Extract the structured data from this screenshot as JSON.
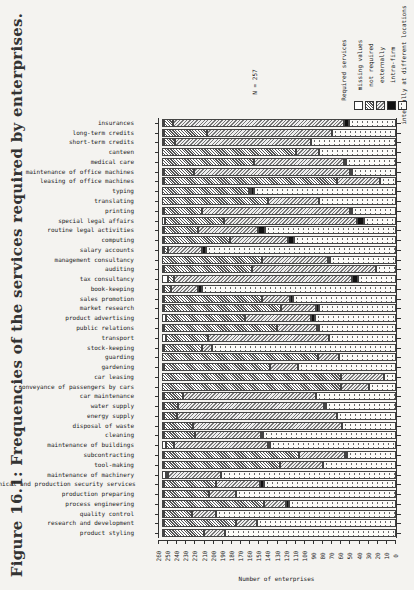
{
  "figure": {
    "title": "Figure 16.1: Frequencies of the services required by enterprises.",
    "n_label": "N = 257"
  },
  "legend": {
    "title": "Required services",
    "items": [
      {
        "key": "missing",
        "label": "missing values",
        "pattern": "p-missing"
      },
      {
        "key": "notreq",
        "label": "not required",
        "pattern": "p-notreq"
      },
      {
        "key": "ext",
        "label": "externally",
        "pattern": "p-ext"
      },
      {
        "key": "intra",
        "label": "intra-firm",
        "pattern": "p-intra"
      },
      {
        "key": "int",
        "label": "internally at different locations",
        "pattern": "p-int"
      }
    ]
  },
  "axis": {
    "xlabel": "Number of enterprises",
    "ticks": [
      260,
      250,
      240,
      230,
      220,
      210,
      200,
      190,
      180,
      170,
      160,
      150,
      140,
      130,
      120,
      110,
      100,
      90,
      80,
      70,
      60,
      50,
      40,
      30,
      20,
      10,
      0
    ]
  },
  "chart_data": {
    "type": "bar",
    "stacked": true,
    "orientation": "horizontal",
    "title": "Figure 16.1: Frequencies of the services required by enterprises.",
    "xlabel": "Number of enterprises",
    "ylabel": "",
    "xlim": [
      260,
      0
    ],
    "annotation": "N = 257",
    "legend_title": "Required services",
    "legend_position": "top-right",
    "grid": false,
    "categories": [
      "insurances",
      "long-term credits",
      "short-term credits",
      "canteen",
      "medical care",
      "maintenance of office machines",
      "leasing of office machines",
      "typing",
      "translating",
      "printing",
      "special legal affairs",
      "routine legal activities",
      "computing",
      "salary accounts",
      "management consultancy",
      "auditing",
      "tax consultancy",
      "book-keeping",
      "sales promotion",
      "market research",
      "product advertising",
      "public relations",
      "transport",
      "stock-keeping",
      "guarding",
      "gardening",
      "car leasing",
      "conveyance of passengers by cars",
      "car maintenance",
      "water supply",
      "energy supply",
      "disposal of waste",
      "cleaning",
      "maintenance of buildings",
      "subcontracting",
      "tool-making",
      "maintenance of machinery",
      "technical and production security services",
      "production preparing",
      "process engineering",
      "quality control",
      "research and development",
      "product styling"
    ],
    "series": [
      {
        "name": "missing values",
        "values": [
          3,
          1,
          1,
          0,
          0,
          3,
          1,
          0,
          0,
          1,
          4,
          2,
          3,
          2,
          0,
          2,
          7,
          1,
          2,
          1,
          5,
          3,
          5,
          2,
          0,
          1,
          0,
          0,
          2,
          2,
          2,
          2,
          2,
          5,
          2,
          2,
          5,
          1,
          1,
          2,
          2,
          1,
          1
        ]
      },
      {
        "name": "not required",
        "values": [
          9,
          48,
          12,
          147,
          102,
          32,
          191,
          96,
          117,
          42,
          64,
          38,
          72,
          5,
          111,
          97,
          6,
          8,
          108,
          129,
          86,
          124,
          46,
          42,
          171,
          117,
          197,
          197,
          21,
          16,
          15,
          32,
          35,
          9,
          149,
          128,
          2,
          58,
          50,
          110,
          31,
          80,
          44
        ]
      },
      {
        "name": "externally",
        "values": [
          188,
          138,
          150,
          26,
          99,
          172,
          47,
          1,
          56,
          164,
          146,
          66,
          64,
          37,
          72,
          136,
          196,
          30,
          31,
          39,
          73,
          44,
          133,
          11,
          24,
          31,
          47,
          30,
          146,
          160,
          175,
          164,
          72,
          103,
          50,
          47,
          58,
          48,
          30,
          24,
          26,
          23,
          24
        ]
      },
      {
        "name": "intra-firm",
        "values": [
          5,
          0,
          0,
          0,
          1,
          2,
          0,
          3,
          0,
          1,
          8,
          7,
          6,
          4,
          1,
          0,
          6,
          4,
          3,
          3,
          4,
          2,
          0,
          0,
          0,
          0,
          0,
          0,
          0,
          2,
          0,
          0,
          1,
          2,
          2,
          0,
          0,
          4,
          0,
          3,
          0,
          0,
          0
        ]
      },
      {
        "name": "internally at different locations",
        "values": [
          52,
          70,
          94,
          84,
          55,
          48,
          18,
          157,
          84,
          49,
          35,
          144,
          112,
          209,
          73,
          22,
          42,
          214,
          113,
          85,
          89,
          84,
          73,
          202,
          62,
          108,
          13,
          30,
          88,
          77,
          65,
          59,
          147,
          138,
          54,
          80,
          192,
          146,
          176,
          118,
          198,
          153,
          188
        ]
      }
    ]
  }
}
